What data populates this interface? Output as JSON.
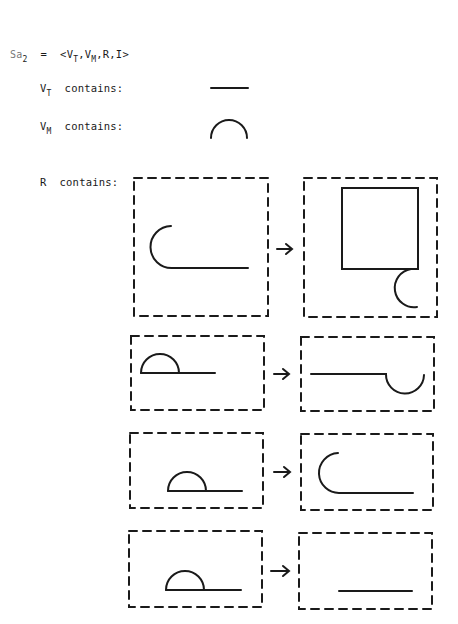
{
  "definition": {
    "name": "Sa",
    "name_subscript": "2",
    "equals": "=",
    "tuple_open": "<",
    "vt": "V",
    "vt_sub": "T",
    "vm": "V",
    "vm_sub": "M",
    "rest": ",R,I>",
    "comma": ","
  },
  "vt_line": {
    "label": "V",
    "sub": "T",
    "suffix": "contains:",
    "symbol": "horizontal-line"
  },
  "vm_line": {
    "label": "V",
    "sub": "M",
    "suffix": "contains:",
    "symbol": "semicircle-arc"
  },
  "r_line": {
    "label": "R",
    "suffix": "contains:"
  },
  "rules": [
    {
      "lhs": "C-hook with horizontal tail",
      "arrow": "→",
      "rhs": "square with hanging semicircle at lower-right"
    },
    {
      "lhs": "semicircle on line (left)",
      "arrow": "→",
      "rhs": "line ending in downward semicircle"
    },
    {
      "lhs": "semicircle on line (center)",
      "arrow": "→",
      "rhs": "C-hook with horizontal tail"
    },
    {
      "lhs": "semicircle on line (center)",
      "arrow": "→",
      "rhs": "horizontal line"
    }
  ],
  "colors": {
    "ink": "#1a1a1a",
    "paper": "#ffffff"
  }
}
